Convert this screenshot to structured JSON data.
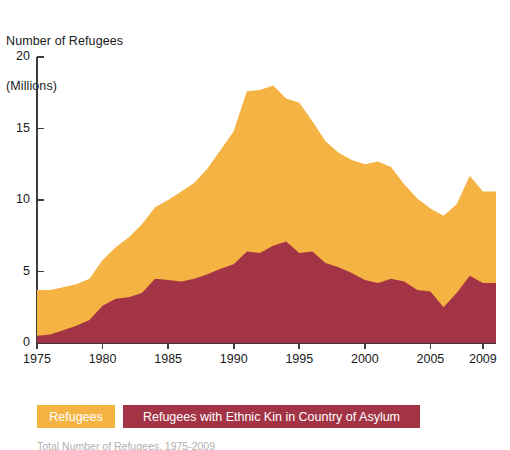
{
  "axis": {
    "y_title_line1": "Number of Refugees",
    "y_title_line2": "(Millions)",
    "y_ticks": [
      "20",
      "15",
      "10",
      "5",
      "0"
    ],
    "x_ticks": [
      "1975",
      "1980",
      "1985",
      "1990",
      "1995",
      "2000",
      "2005",
      "2009"
    ]
  },
  "legend": {
    "refugees_label": "Refugees",
    "ethnic_kin_label": "Refugees with Ethnic Kin in Country of Asylum"
  },
  "caption": {
    "text": "Total Number of Refugees, 1975-2009"
  },
  "colors": {
    "refugees": "#F5B344",
    "ethnic_kin": "#A33446",
    "axis": "#3c3c3c",
    "background": "#ffffff",
    "legend_text": "#ffffff"
  },
  "chart_data": {
    "type": "area",
    "stacked": true,
    "title": "",
    "xlabel": "",
    "ylabel": "Number of Refugees (Millions)",
    "xlim": [
      1975,
      2010
    ],
    "ylim": [
      0,
      20
    ],
    "grid": false,
    "legend_position": "bottom-left",
    "x": [
      1975,
      1976,
      1977,
      1978,
      1979,
      1980,
      1981,
      1982,
      1983,
      1984,
      1985,
      1986,
      1987,
      1988,
      1989,
      1990,
      1991,
      1992,
      1993,
      1994,
      1995,
      1996,
      1997,
      1998,
      1999,
      2000,
      2001,
      2002,
      2003,
      2004,
      2005,
      2006,
      2007,
      2008,
      2009
    ],
    "series": [
      {
        "name": "Refugees with Ethnic Kin in Country of Asylum",
        "color": "#A33446",
        "values": [
          0.5,
          0.6,
          0.9,
          1.2,
          1.6,
          2.6,
          3.1,
          3.2,
          3.5,
          4.5,
          4.4,
          4.3,
          4.5,
          4.8,
          5.2,
          5.5,
          6.4,
          6.3,
          6.8,
          7.1,
          6.3,
          6.4,
          5.6,
          5.3,
          4.9,
          4.4,
          4.2,
          4.5,
          4.3,
          3.7,
          3.6,
          2.5,
          3.5,
          4.7,
          4.2
        ]
      },
      {
        "name": "Refugees",
        "color": "#F5B344",
        "values": [
          3.2,
          3.1,
          3.0,
          2.9,
          2.9,
          3.2,
          3.6,
          4.2,
          4.8,
          5.0,
          5.6,
          6.3,
          6.7,
          7.4,
          8.3,
          9.3,
          11.2,
          11.4,
          11.2,
          10.0,
          10.5,
          9.1,
          8.5,
          8.0,
          7.9,
          8.1,
          8.5,
          7.8,
          6.8,
          6.4,
          5.8,
          6.4,
          6.2,
          7.0,
          6.4
        ]
      }
    ],
    "totals": [
      3.7,
      3.7,
      3.9,
      4.1,
      4.5,
      5.8,
      6.7,
      7.4,
      8.3,
      9.5,
      10.0,
      10.6,
      11.2,
      12.2,
      13.5,
      14.8,
      17.6,
      17.7,
      18.0,
      17.1,
      16.8,
      15.5,
      14.1,
      13.3,
      12.8,
      12.5,
      12.7,
      12.3,
      11.1,
      10.1,
      9.4,
      8.9,
      9.7,
      11.7,
      10.6
    ]
  }
}
